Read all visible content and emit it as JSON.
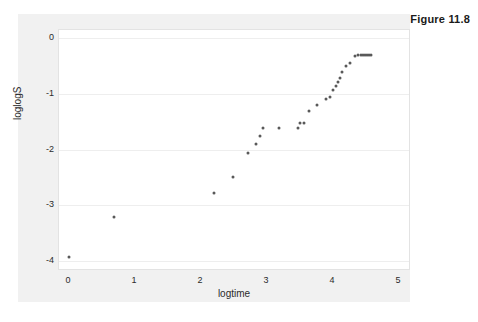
{
  "figure": {
    "caption": "Figure 11.8"
  },
  "chart_data": {
    "type": "scatter",
    "title": "Figure 11.8",
    "xlabel": "logtime",
    "ylabel": "loglogS",
    "xlim": [
      -0.15,
      5.15
    ],
    "ylim": [
      -4.15,
      0.15
    ],
    "xticks": [
      0,
      1,
      2,
      3,
      4,
      5
    ],
    "xtick_labels": [
      "0",
      "1",
      "2",
      "3",
      "4",
      "5"
    ],
    "yticks": [
      0,
      -1,
      -2,
      -3,
      -4
    ],
    "ytick_labels": [
      "0",
      "-1",
      "-2",
      "-3",
      "-4"
    ],
    "grid": "horizontal",
    "legend": "none",
    "marker_color": "#595959",
    "panel_color": "#f1f1f1",
    "plot_background": "#ffffff",
    "gridline_color": "#eeeeee",
    "series": [
      {
        "name": "loglogS vs logtime",
        "points": [
          [
            0.0,
            -3.93
          ],
          [
            0.69,
            -3.22
          ],
          [
            2.2,
            -2.78
          ],
          [
            2.48,
            -2.49
          ],
          [
            2.71,
            -2.06
          ],
          [
            2.83,
            -1.9
          ],
          [
            2.89,
            -1.75
          ],
          [
            2.94,
            -1.62
          ],
          [
            3.18,
            -1.62
          ],
          [
            3.47,
            -1.62
          ],
          [
            3.5,
            -1.52
          ],
          [
            3.56,
            -1.52
          ],
          [
            3.64,
            -1.31
          ],
          [
            3.76,
            -1.2
          ],
          [
            3.89,
            -1.09
          ],
          [
            3.95,
            -1.06
          ],
          [
            4.0,
            -0.93
          ],
          [
            4.04,
            -0.86
          ],
          [
            4.07,
            -0.79
          ],
          [
            4.11,
            -0.72
          ],
          [
            4.14,
            -0.61
          ],
          [
            4.19,
            -0.49
          ],
          [
            4.25,
            -0.44
          ],
          [
            4.33,
            -0.31
          ],
          [
            4.38,
            -0.3
          ],
          [
            4.42,
            -0.3
          ],
          [
            4.45,
            -0.3
          ],
          [
            4.48,
            -0.3
          ],
          [
            4.51,
            -0.3
          ],
          [
            4.54,
            -0.3
          ],
          [
            4.57,
            -0.3
          ]
        ]
      }
    ]
  }
}
